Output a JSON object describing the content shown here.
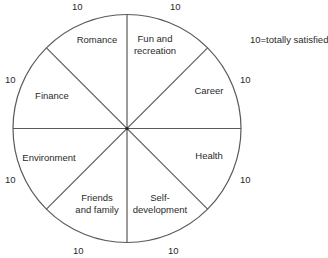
{
  "diagram": {
    "type": "wheel-of-life",
    "legend": "10=totally satisfied",
    "max_score_label": "10",
    "segments": [
      {
        "key": "romance",
        "label_lines": [
          "Romance"
        ],
        "score_label": "10"
      },
      {
        "key": "fun",
        "label_lines": [
          "Fun and",
          "recreation"
        ],
        "score_label": "10"
      },
      {
        "key": "career",
        "label_lines": [
          "Career"
        ],
        "score_label": "10"
      },
      {
        "key": "health",
        "label_lines": [
          "Health"
        ],
        "score_label": "10"
      },
      {
        "key": "self",
        "label_lines": [
          "Self-",
          "development"
        ],
        "score_label": "10"
      },
      {
        "key": "friends",
        "label_lines": [
          "Friends",
          "and family"
        ],
        "score_label": "10"
      },
      {
        "key": "environment",
        "label_lines": [
          "Environment"
        ],
        "score_label": "10"
      },
      {
        "key": "finance",
        "label_lines": [
          "Finance"
        ],
        "score_label": "10"
      }
    ],
    "colors": {
      "line": "#5a5a5a",
      "text": "#2a2a2a",
      "background": "#ffffff"
    }
  }
}
